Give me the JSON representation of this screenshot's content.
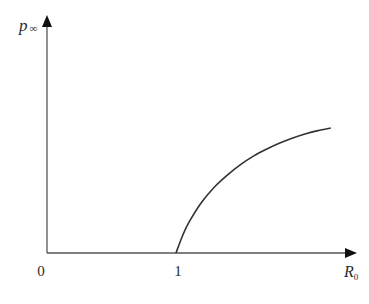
{
  "chart_data": {
    "type": "line",
    "title": "",
    "xlabel": "R0",
    "xlabel_main": "R",
    "xlabel_sub": "0",
    "ylabel": "p∞",
    "ylabel_main": "p",
    "ylabel_sub": "∞",
    "x_ticks": [
      "0",
      "1"
    ],
    "x_tick_values": [
      0,
      1
    ],
    "xlim": [
      0,
      2.25
    ],
    "ylim": [
      0,
      1
    ],
    "grid": false,
    "legend": null,
    "series": [
      {
        "name": "p∞(R0)",
        "description": "zero for R0 ≤ 1, rising concavely for R0 > 1 toward a saturation level",
        "x": [
          1.0,
          1.05,
          1.1,
          1.2,
          1.3,
          1.4,
          1.5,
          1.6,
          1.7,
          1.8,
          1.9,
          2.0,
          2.1,
          2.2
        ],
        "y": [
          0.0,
          0.1,
          0.18,
          0.3,
          0.39,
          0.46,
          0.52,
          0.57,
          0.61,
          0.645,
          0.675,
          0.7,
          0.72,
          0.735
        ]
      }
    ]
  },
  "colors": {
    "axis": "#555555",
    "curve": "#333333",
    "arrow": "#111111",
    "text": "#2a2a2a"
  }
}
